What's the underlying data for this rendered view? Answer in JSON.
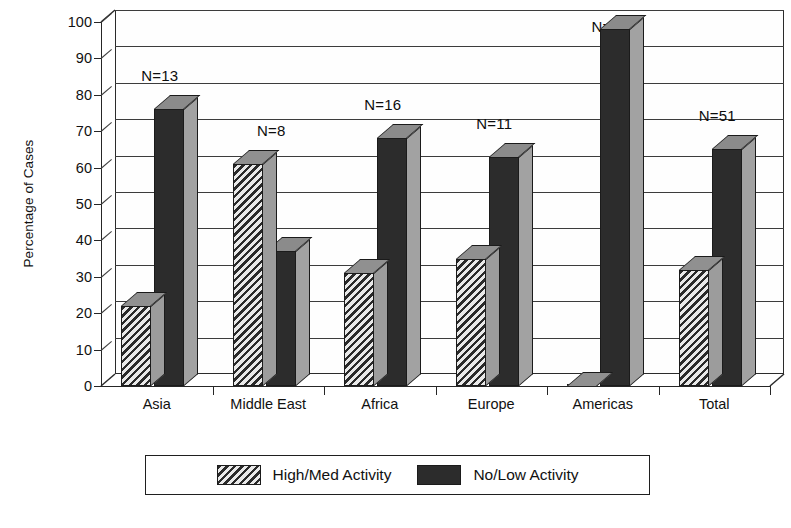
{
  "chart_data": {
    "type": "bar",
    "title": "",
    "subtitle": "",
    "xlabel": "",
    "ylabel": "Percentage of Cases",
    "ylim": [
      0,
      100
    ],
    "ytick_step": 10,
    "yticks": [
      0,
      10,
      20,
      30,
      40,
      50,
      60,
      70,
      80,
      90,
      100
    ],
    "grid": true,
    "grid_axis": "y",
    "style": "3d-bar",
    "legend_position": "bottom-center",
    "categories": [
      "Asia",
      "Middle East",
      "Africa",
      "Europe",
      "Americas",
      "Total"
    ],
    "series": [
      {
        "name": "High/Med Activity",
        "fill": "diagonal-hatch",
        "color": "#4a4a4a",
        "values": [
          22,
          61,
          31,
          35,
          0,
          32
        ]
      },
      {
        "name": "No/Low Activity",
        "fill": "solid",
        "color": "#2c2c2c",
        "values": [
          76,
          37,
          68,
          63,
          98,
          65
        ]
      }
    ],
    "annotations": [
      {
        "category": "Asia",
        "text": "N=13",
        "value": 13
      },
      {
        "category": "Middle East",
        "text": "N=8",
        "value": 8
      },
      {
        "category": "Africa",
        "text": "N=16",
        "value": 16
      },
      {
        "category": "Europe",
        "text": "N=11",
        "value": 11
      },
      {
        "category": "Americas",
        "text": "N=3",
        "value": 3
      },
      {
        "category": "Total",
        "text": "N=51",
        "value": 51
      }
    ]
  },
  "legend": {
    "items": [
      {
        "label": "High/Med Activity",
        "swatch": "hatch"
      },
      {
        "label": "No/Low Activity",
        "swatch": "solid"
      }
    ]
  },
  "colors": {
    "axis": "#262626",
    "gridline": "#3c3c3c",
    "bar_outline": "#1b1b1b",
    "bar_top_face": "#8f8f8f",
    "bar_side_face": "#9c9c9c",
    "background": "#ffffff"
  }
}
